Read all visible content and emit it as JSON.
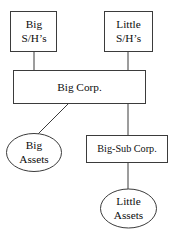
{
  "diagram": {
    "colors": {
      "stroke": "#3b3b3b",
      "fill": "#ffffff",
      "text": "#0d0d0d",
      "background": "#ffffff"
    },
    "nodes": [
      {
        "id": "big-shareholders",
        "shape": "rectangle",
        "line1": "Big",
        "line2": "S/H’s",
        "x": 10,
        "y": 11,
        "width": 47,
        "height": 41
      },
      {
        "id": "little-shareholders",
        "shape": "rectangle",
        "line1": "Little",
        "line2": "S/H’s",
        "x": 104,
        "y": 11,
        "width": 49,
        "height": 41
      },
      {
        "id": "big-corp",
        "shape": "rectangle",
        "line1": "Big Corp.",
        "line2": "",
        "x": 13,
        "y": 70,
        "width": 133,
        "height": 34
      },
      {
        "id": "big-assets",
        "shape": "ellipse",
        "line1": "Big",
        "line2": "Assets",
        "x": 6,
        "y": 133,
        "width": 56,
        "height": 39
      },
      {
        "id": "big-sub-corp",
        "shape": "rectangle",
        "line1": "Big-Sub Corp.",
        "line2": "",
        "x": 86,
        "y": 135,
        "width": 82,
        "height": 28
      },
      {
        "id": "little-assets",
        "shape": "ellipse",
        "line1": "Little",
        "line2": "Assets",
        "x": 100,
        "y": 189,
        "width": 57,
        "height": 39
      }
    ],
    "edges": [
      {
        "id": "big-sh-to-big-corp",
        "from": "big-shareholders",
        "to": "big-corp",
        "x1": 34,
        "y1": 52,
        "x2": 34,
        "y2": 70
      },
      {
        "id": "little-sh-to-big-corp",
        "from": "little-shareholders",
        "to": "big-corp",
        "x1": 128,
        "y1": 52,
        "x2": 128,
        "y2": 70
      },
      {
        "id": "big-corp-to-big-assets",
        "from": "big-corp",
        "to": "big-assets",
        "x1": 68,
        "y1": 104,
        "x2": 37,
        "y2": 135
      },
      {
        "id": "big-corp-to-big-sub-corp",
        "from": "big-corp",
        "to": "big-sub-corp",
        "x1": 128,
        "y1": 104,
        "x2": 128,
        "y2": 135
      },
      {
        "id": "big-sub-corp-to-little-assets",
        "from": "big-sub-corp",
        "to": "little-assets",
        "x1": 128,
        "y1": 163,
        "x2": 128,
        "y2": 190
      }
    ]
  }
}
